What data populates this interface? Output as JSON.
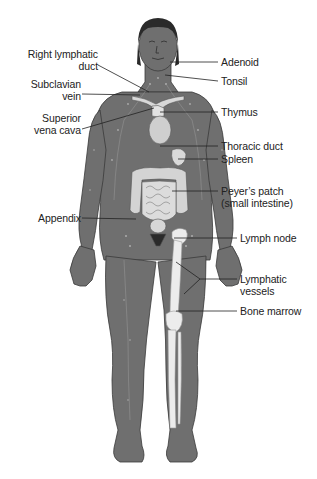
{
  "diagram": {
    "colors": {
      "body": "#6f6f6f",
      "body_outline": "#3a3a3a",
      "organ": "#d8d8d8",
      "bone": "#ececec",
      "hair": "#2a2a2a",
      "leader_line": "#222222",
      "text": "#222222"
    },
    "labels_left": [
      {
        "id": "right-lymphatic-duct",
        "lines": [
          "Right lymphatic",
          "duct"
        ]
      },
      {
        "id": "subclavian-vein",
        "lines": [
          "Subclavian",
          "vein"
        ]
      },
      {
        "id": "superior-vena-cava",
        "lines": [
          "Superior",
          "vena cava"
        ]
      },
      {
        "id": "appendix",
        "lines": [
          "Appendix"
        ]
      }
    ],
    "labels_right": [
      {
        "id": "adenoid",
        "lines": [
          "Adenoid"
        ]
      },
      {
        "id": "tonsil",
        "lines": [
          "Tonsil"
        ]
      },
      {
        "id": "thymus",
        "lines": [
          "Thymus"
        ]
      },
      {
        "id": "thoracic-duct",
        "lines": [
          "Thoracic duct"
        ]
      },
      {
        "id": "spleen",
        "lines": [
          "Spleen"
        ]
      },
      {
        "id": "peyers-patch",
        "lines": [
          "Peyer’s patch",
          "(small intestine)"
        ]
      },
      {
        "id": "lymph-node",
        "lines": [
          "Lymph node"
        ]
      },
      {
        "id": "lymphatic-vessels",
        "lines": [
          "Lymphatic",
          "vessels"
        ]
      },
      {
        "id": "bone-marrow",
        "lines": [
          "Bone marrow"
        ]
      }
    ]
  }
}
